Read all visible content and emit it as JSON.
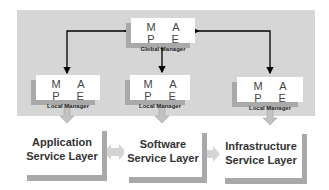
{
  "diagram": {
    "global_manager": {
      "title": "M A P E",
      "subtitle": "Global Manager"
    },
    "local_managers": [
      {
        "title": "M A P E",
        "subtitle": "Local Manager"
      },
      {
        "title": "M A P E",
        "subtitle": "Local Manager"
      },
      {
        "title": "M A P E",
        "subtitle": "Local Manager"
      }
    ],
    "service_layers": [
      {
        "line1": "Application",
        "line2": "Service Layer"
      },
      {
        "line1": "Software",
        "line2": "Service Layer"
      },
      {
        "line1": "Infrastructure",
        "line2": "Service Layer"
      }
    ],
    "colors": {
      "background_panel": "#d6d6d6",
      "shadow": "#a9a9a9",
      "arrow": "#000000",
      "block_arrow": "#b8b8b8"
    }
  }
}
